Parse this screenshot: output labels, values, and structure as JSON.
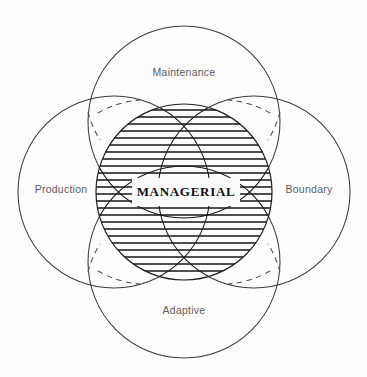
{
  "diagram": {
    "background_color": "#fdfdfd",
    "canvas": {
      "width": 367,
      "height": 377
    },
    "center": {
      "label": "MANAGERIAL",
      "shape": "hatched-circle",
      "cx": 184,
      "cy": 192,
      "r": 88,
      "fill_pattern": "horizontal-hatching",
      "stroke_color": "#1c1c1c",
      "label_box": {
        "x": 132,
        "y": 178,
        "width": 108,
        "height": 28,
        "fill": "#fbfbfb"
      }
    },
    "subsystems": [
      {
        "key": "top",
        "label": "Maintenance",
        "cx": 184,
        "cy": 122,
        "r": 96,
        "label_x": 184,
        "label_y": 73,
        "stroke_color": "#3a3a3a"
      },
      {
        "key": "left",
        "label": "Production",
        "cx": 114,
        "cy": 192,
        "r": 96,
        "label_x": 61,
        "label_y": 190,
        "stroke_color": "#3a3a3a"
      },
      {
        "key": "right",
        "label": "Boundary",
        "cx": 254,
        "cy": 192,
        "r": 96,
        "label_x": 309,
        "label_y": 190,
        "stroke_color": "#3a3a3a"
      },
      {
        "key": "bottom",
        "label": "Adaptive",
        "cx": 184,
        "cy": 262,
        "r": 96,
        "label_x": 184,
        "label_y": 311,
        "stroke_color": "#3a3a3a"
      }
    ],
    "dashed_arcs_note": "dashed",
    "label_text_color": "#5c5c5c",
    "center_text_color": "#111111"
  }
}
